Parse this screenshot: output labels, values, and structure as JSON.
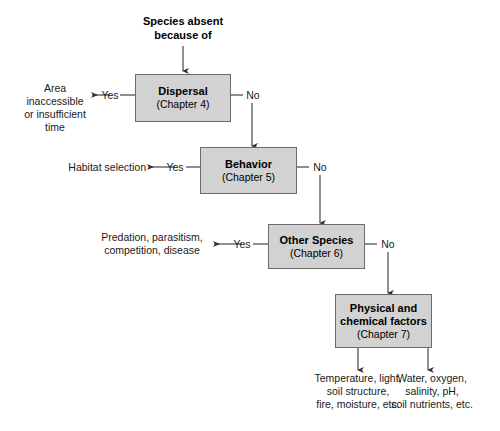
{
  "diagram": {
    "title": "Species absent\nbecause of",
    "yes_label": "Yes",
    "no_label": "No",
    "nodes": [
      {
        "title": "Dispersal",
        "sub": "(Chapter 4)"
      },
      {
        "title": "Behavior",
        "sub": "(Chapter 5)"
      },
      {
        "title": "Other Species",
        "sub": "(Chapter 6)"
      },
      {
        "title": "Physical and\nchemical factors",
        "sub": "(Chapter 7)"
      }
    ],
    "outcomes": [
      "Area\ninaccessible\nor insufficient\ntime",
      "Habitat selection",
      "Predation, parasitism,\ncompetition, disease",
      "Temperature, light,\nsoil structure,\nfire, moisture, etc.",
      "Water, oxygen,\nsalinity, pH,\nsoil nutrients, etc."
    ],
    "edge_labels": {
      "yes1": "Yes",
      "no1": "No",
      "yes2": "Yes",
      "no2": "No",
      "yes3": "Yes",
      "no3": "No"
    },
    "colors": {
      "box_fill": "#d2d2d2",
      "box_border": "#6b6b6b",
      "line": "#333333",
      "text": "#1a1a1a"
    }
  }
}
